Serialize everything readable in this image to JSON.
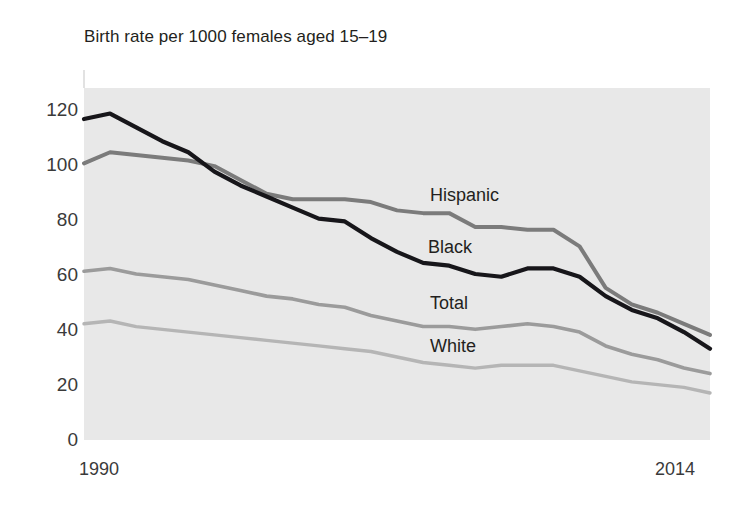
{
  "chart_data": {
    "type": "line",
    "title": "Birth rate per 1000 females aged 15–19",
    "xlabel": "",
    "ylabel": "",
    "xlim": [
      1990,
      2014
    ],
    "ylim": [
      0,
      130
    ],
    "grid": false,
    "legend_position": "inline-labels",
    "x_tick_labels": [
      "1990",
      "2014"
    ],
    "y_tick_labels": [
      "0",
      "20",
      "40",
      "60",
      "80",
      "100",
      "120"
    ],
    "y_ticks": [
      0,
      20,
      40,
      60,
      80,
      100,
      120
    ],
    "x": [
      1990,
      1991,
      1992,
      1993,
      1994,
      1995,
      1996,
      1997,
      1998,
      1999,
      2000,
      2001,
      2002,
      2003,
      2004,
      2005,
      2006,
      2007,
      2008,
      2009,
      2010,
      2011,
      2012,
      2013,
      2014
    ],
    "categories": [
      "1990",
      "1991",
      "1992",
      "1993",
      "1994",
      "1995",
      "1996",
      "1997",
      "1998",
      "1999",
      "2000",
      "2001",
      "2002",
      "2003",
      "2004",
      "2005",
      "2006",
      "2007",
      "2008",
      "2009",
      "2010",
      "2011",
      "2012",
      "2013",
      "2014"
    ],
    "series": [
      {
        "name": "Black",
        "label": "Black",
        "color": "#17161a",
        "width": 4.2,
        "values": [
          116,
          118,
          113,
          108,
          104,
          97,
          92,
          88,
          84,
          80,
          79,
          73,
          68,
          64,
          63,
          60,
          59,
          62,
          62,
          59,
          52,
          47,
          44,
          39,
          33
        ]
      },
      {
        "name": "Hispanic",
        "label": "Hispanic",
        "color": "#7b7b7b",
        "width": 4.0,
        "values": [
          100,
          104,
          103,
          102,
          101,
          99,
          94,
          89,
          87,
          87,
          87,
          86,
          83,
          82,
          82,
          77,
          77,
          76,
          76,
          70,
          55,
          49,
          46,
          42,
          38
        ]
      },
      {
        "name": "Total",
        "label": "Total",
        "color": "#9b9b9b",
        "width": 3.6,
        "values": [
          61,
          62,
          60,
          59,
          58,
          56,
          54,
          52,
          51,
          49,
          48,
          45,
          43,
          41,
          41,
          40,
          41,
          42,
          41,
          39,
          34,
          31,
          29,
          26,
          24
        ]
      },
      {
        "name": "White",
        "label": "White",
        "color": "#b5b5b5",
        "width": 3.4,
        "values": [
          42,
          43,
          41,
          40,
          39,
          38,
          37,
          36,
          35,
          34,
          33,
          32,
          30,
          28,
          27,
          26,
          27,
          27,
          27,
          25,
          23,
          21,
          20,
          19,
          17
        ]
      }
    ],
    "series_label_positions": [
      {
        "name": "Hispanic",
        "x": 430,
        "y": 186
      },
      {
        "name": "Black",
        "x": 428,
        "y": 238
      },
      {
        "name": "Total",
        "x": 430,
        "y": 294
      },
      {
        "name": "White",
        "x": 430,
        "y": 337
      }
    ],
    "plot_background_color": "#e8e8e8",
    "page_background_color": "#ffffff",
    "axis_text_color": "#3a3a3a"
  }
}
